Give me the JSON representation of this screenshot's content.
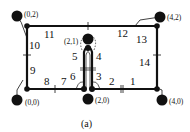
{
  "figure": {
    "caption": "(a)",
    "terminals": [
      {
        "id": "t02",
        "label": "(0,2)"
      },
      {
        "id": "t42",
        "label": "(4,2)"
      },
      {
        "id": "t00",
        "label": "(0,0)"
      },
      {
        "id": "t40",
        "label": "(4,0)"
      },
      {
        "id": "t20",
        "label": "(2,0)"
      },
      {
        "id": "t21",
        "label": "(2,1)"
      }
    ],
    "edge_labels": [
      "1",
      "2",
      "3",
      "4",
      "5",
      "6",
      "7",
      "8",
      "9",
      "10",
      "11",
      "12",
      "13",
      "14"
    ]
  }
}
